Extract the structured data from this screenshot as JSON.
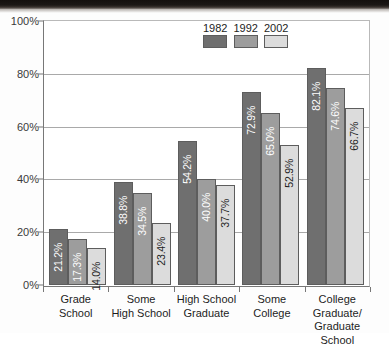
{
  "chart_data": {
    "type": "bar",
    "title": "",
    "xlabel": "",
    "ylabel": "",
    "ylim": [
      0,
      100
    ],
    "yticks": [
      "0%",
      "20%",
      "40%",
      "60%",
      "80%",
      "100%"
    ],
    "ytick_values": [
      0,
      20,
      40,
      60,
      80,
      100
    ],
    "grid": true,
    "legend_position": "top-center",
    "categories": [
      "Grade School",
      "Some High School",
      "High School Graduate",
      "Some College",
      "College Graduate/ Graduate School"
    ],
    "category_lines": [
      [
        "Grade School",
        ""
      ],
      [
        "Some",
        "High School"
      ],
      [
        "High School",
        "Graduate"
      ],
      [
        "Some",
        "College"
      ],
      [
        "College Graduate/",
        "Graduate School"
      ]
    ],
    "series": [
      {
        "name": "1982",
        "color": "#6f6f6f",
        "values": [
          21.2,
          38.8,
          54.2,
          72.9,
          82.1
        ],
        "labels": [
          "21.2%",
          "38.8%",
          "54.2%",
          "72.9%",
          "82.1%"
        ]
      },
      {
        "name": "1992",
        "color": "#9d9d9d",
        "values": [
          17.3,
          34.5,
          40.0,
          65.0,
          74.6
        ],
        "labels": [
          "17.3%",
          "34.5%",
          "40.0%",
          "65.0%",
          "74.6%"
        ]
      },
      {
        "name": "2002",
        "color": "#dcdcdc",
        "values": [
          14.0,
          23.4,
          37.7,
          52.9,
          66.7
        ],
        "labels": [
          "14.0%",
          "23.4%",
          "37.7%",
          "52.9%",
          "66.7%"
        ]
      }
    ]
  }
}
